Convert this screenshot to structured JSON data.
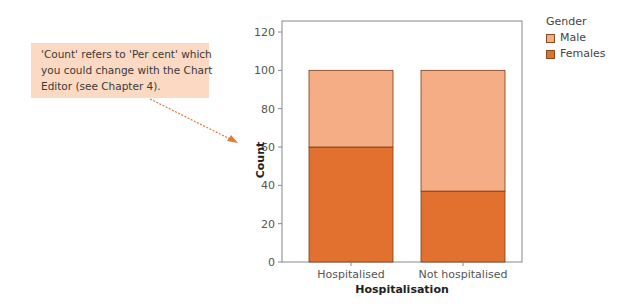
{
  "callout": {
    "lines": [
      "'Count' refers to 'Per cent' which",
      "you could change with the Chart",
      "Editor (see Chapter 4)."
    ],
    "background": "#fbd9c3",
    "arrow_color": "#e07a3a"
  },
  "legend": {
    "title": "Gender",
    "items": [
      {
        "label": "Male",
        "color": "#f5ad85"
      },
      {
        "label": "Females",
        "color": "#e2702f"
      }
    ]
  },
  "chart_data": {
    "type": "bar",
    "stacked": true,
    "title": "",
    "xlabel": "Hospitalisation",
    "ylabel": "Count",
    "ylim": [
      0,
      120
    ],
    "yticks": [
      0,
      20,
      40,
      60,
      80,
      100,
      120
    ],
    "categories": [
      "Hospitalised",
      "Not hospitalised"
    ],
    "series": [
      {
        "name": "Females",
        "values": [
          60,
          37
        ],
        "color": "#e2702f"
      },
      {
        "name": "Male",
        "values": [
          40,
          63
        ],
        "color": "#f5ad85"
      }
    ],
    "grid": false,
    "legend_position": "right"
  }
}
